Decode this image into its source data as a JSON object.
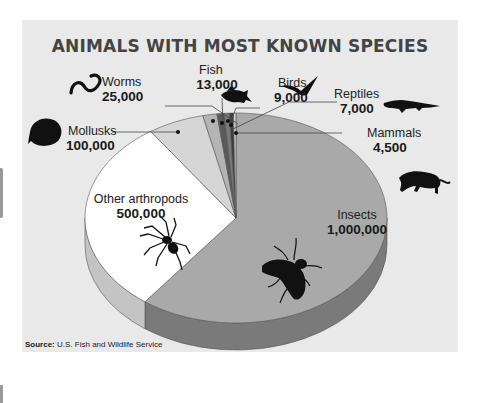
{
  "chart_data": {
    "type": "pie",
    "title": "ANIMALS WITH MOST KNOWN SPECIES",
    "three_d": true,
    "categories": [
      "Insects",
      "Other arthropods",
      "Mollusks",
      "Worms",
      "Fish",
      "Birds",
      "Reptiles",
      "Mammals"
    ],
    "values": [
      1000000,
      500000,
      100000,
      25000,
      13000,
      9000,
      7000,
      4500
    ],
    "labels": [
      "1,000,000",
      "500,000",
      "100,000",
      "25,000",
      "13,000",
      "9,000",
      "7,000",
      "4,500"
    ],
    "colors": [
      "#a9a9a9",
      "#ffffff",
      "#d6d6d6",
      "#b4b4b4",
      "#5a5a5a",
      "#7a7a7a",
      "#3e3e3e",
      "#d0d0d0"
    ],
    "side_colors": [
      "#7a7a7a",
      "#c4c4c4",
      "#a8a8a8",
      "#8c8c8c",
      "#444",
      "#5e5e5e",
      "#2f2f2f",
      "#a0a0a0"
    ],
    "icons": [
      "fly-icon",
      "spider-icon",
      "clam-icon",
      "worm-icon",
      "fish-icon",
      "bird-icon",
      "crocodile-icon",
      "panther-icon"
    ],
    "source": "U.S. Fish and Wildlife Service"
  },
  "header": {
    "title": "ANIMALS WITH MOST KNOWN SPECIES"
  },
  "labels": {
    "worms": {
      "name": "Worms",
      "value": "25,000"
    },
    "fish": {
      "name": "Fish",
      "value": "13,000"
    },
    "birds": {
      "name": "Birds",
      "value": "9,000"
    },
    "reptiles": {
      "name": "Reptiles",
      "value": "7,000"
    },
    "mammals": {
      "name": "Mammals",
      "value": "4,500"
    },
    "mollusks": {
      "name": "Mollusks",
      "value": "100,000"
    },
    "other_arthropods": {
      "name": "Other arthropods",
      "value": "500,000"
    },
    "insects": {
      "name": "Insects",
      "value": "1,000,000"
    }
  },
  "footer": {
    "source_label": "Source:",
    "source_text": "U.S. Fish and Wildlife Service"
  }
}
